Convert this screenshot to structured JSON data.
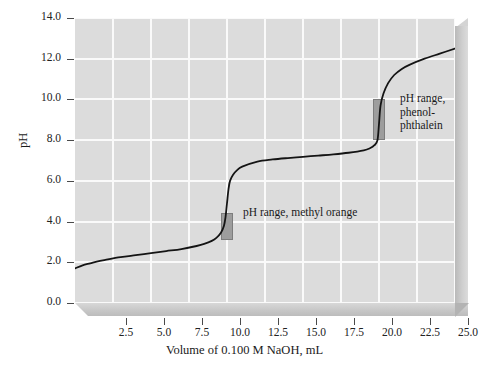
{
  "chart_data": {
    "type": "line",
    "title": "",
    "xlabel": "Volume of 0.100 M NaOH, mL",
    "ylabel": "pH",
    "xlim": [
      0.0,
      25.0
    ],
    "ylim": [
      0.0,
      14.0
    ],
    "grid": true,
    "legend": "none",
    "xticks": [
      "2.5",
      "5.0",
      "7.5",
      "10.0",
      "12.5",
      "15.0",
      "17.5",
      "20.0",
      "22.5",
      "25.0"
    ],
    "xtick_values": [
      2.5,
      5.0,
      7.5,
      10.0,
      12.5,
      15.0,
      17.5,
      20.0,
      22.5,
      25.0
    ],
    "yticks": [
      "0.0",
      "2.0",
      "4.0",
      "6.0",
      "8.0",
      "10.0",
      "12.0",
      "14.0"
    ],
    "ytick_values": [
      0.0,
      2.0,
      4.0,
      6.0,
      8.0,
      10.0,
      12.0,
      14.0
    ],
    "series": [
      {
        "name": "Titration curve of weak/strong diprotic acid with 0.100 M NaOH",
        "x": [
          0.0,
          0.5,
          1.0,
          1.5,
          2.0,
          3.0,
          4.0,
          5.0,
          6.0,
          7.0,
          8.0,
          8.5,
          9.0,
          9.3,
          9.6,
          9.8,
          9.9,
          10.0,
          10.1,
          10.2,
          10.4,
          10.7,
          11.0,
          12.0,
          13.0,
          14.0,
          15.0,
          16.0,
          17.0,
          18.0,
          19.0,
          19.4,
          19.7,
          19.9,
          20.0,
          20.1,
          20.3,
          20.6,
          21.0,
          21.5,
          22.0,
          23.0,
          24.0,
          25.0
        ],
        "y": [
          1.7,
          1.85,
          1.95,
          2.05,
          2.12,
          2.25,
          2.35,
          2.45,
          2.55,
          2.65,
          2.8,
          2.9,
          3.05,
          3.2,
          3.45,
          3.8,
          4.2,
          4.9,
          5.6,
          6.0,
          6.3,
          6.55,
          6.7,
          6.95,
          7.05,
          7.12,
          7.18,
          7.24,
          7.3,
          7.38,
          7.5,
          7.6,
          7.75,
          8.0,
          8.8,
          9.7,
          10.3,
          10.8,
          11.2,
          11.5,
          11.7,
          12.0,
          12.25,
          12.5
        ]
      }
    ],
    "annotations": [
      {
        "name": "methyl-orange",
        "text": "pH range, methyl orange",
        "band_x": 10.0,
        "band_ph_low": 3.1,
        "band_ph_high": 4.4
      },
      {
        "name": "phenolphthalein",
        "text": "pH range,\nphenol-\nphthalein",
        "band_x": 20.0,
        "band_ph_low": 8.0,
        "band_ph_high": 10.0
      }
    ],
    "colors": {
      "plot_background": "#dcdcdc",
      "gridline": "#fafafa",
      "curve": "#141414",
      "band_fill": "#9d9d9d",
      "band_stroke": "#7d7d7d",
      "page_background": "#ffffff"
    }
  }
}
